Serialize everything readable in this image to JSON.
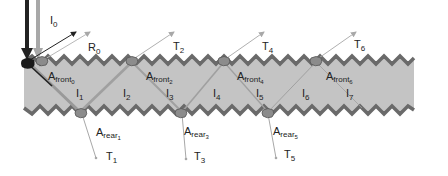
{
  "diagram": {
    "colors": {
      "slab_fill": "#c4c4c4",
      "edge": "#6a6a6a",
      "ray_light": "#a8a8a8",
      "ray_dark": "#222222",
      "blob": "#8c8c8c"
    },
    "incident": {
      "label": "I",
      "sub": "0"
    },
    "reflected": {
      "label": "R",
      "sub": "0"
    },
    "internal": [
      {
        "label": "I",
        "sub": "1"
      },
      {
        "label": "I",
        "sub": "2"
      },
      {
        "label": "I",
        "sub": "3"
      },
      {
        "label": "I",
        "sub": "4"
      },
      {
        "label": "I",
        "sub": "5"
      },
      {
        "label": "I",
        "sub": "6"
      },
      {
        "label": "I",
        "sub": "7"
      }
    ],
    "front_transmitted": [
      {
        "label": "T",
        "sub": "2"
      },
      {
        "label": "T",
        "sub": "4"
      },
      {
        "label": "T",
        "sub": "6"
      }
    ],
    "rear_transmitted": [
      {
        "label": "T",
        "sub": "1"
      },
      {
        "label": "T",
        "sub": "3"
      },
      {
        "label": "T",
        "sub": "5"
      }
    ],
    "front_areas": [
      {
        "label": "A",
        "sub": "front",
        "subsub": "0"
      },
      {
        "label": "A",
        "sub": "front",
        "subsub": "2"
      },
      {
        "label": "A",
        "sub": "front",
        "subsub": "4"
      },
      {
        "label": "A",
        "sub": "front",
        "subsub": "6"
      }
    ],
    "rear_areas": [
      {
        "label": "A",
        "sub": "rear",
        "subsub": "1"
      },
      {
        "label": "A",
        "sub": "rear",
        "subsub": "3"
      },
      {
        "label": "A",
        "sub": "rear",
        "subsub": "5"
      }
    ]
  }
}
